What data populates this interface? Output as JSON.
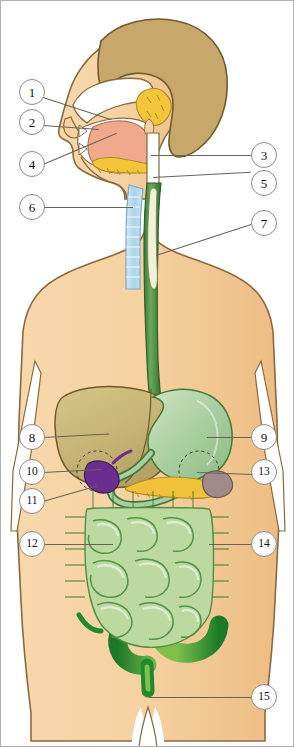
{
  "diagram": {
    "view": "sagittal head and anterior torso",
    "background_color": "#ffffff",
    "border_color": "#b0b0b0",
    "palette": {
      "skin": "#f5cf9d",
      "skin_shadow": "#eabf86",
      "skin_outline": "#8a6a3c",
      "hair": "#c8a76a",
      "hair_outline": "#6e5a33",
      "tongue": "#f0a98b",
      "salivary_gland": "#f2c githubusercontent",
      "salivary": "#f3c53a",
      "trachea": "#b8dced",
      "esophagus": "#4e8f43",
      "esophagus_lumen": "#f2f0d8",
      "liver": "#c9b877",
      "liver_outline": "#6b5a2a",
      "stomach": "#a9cfa0",
      "stomach_outline": "#3f7a3a",
      "gallbladder": "#6b2e8f",
      "pancreas": "#f0c23a",
      "spleen": "#a08a8a",
      "large_intestine": "#1f8a2e",
      "small_intestine": "#bcd9a0",
      "small_intestine_outline": "#4e8f43",
      "leader_line": "#6b6257",
      "callout_ring": "#8a8a8a"
    },
    "callouts": [
      {
        "n": "1",
        "label": "1",
        "side": "left",
        "x": 18,
        "y": 78,
        "target_x": 108,
        "target_y": 120,
        "organ": "nasal-cavity"
      },
      {
        "n": "2",
        "label": "2",
        "side": "left",
        "x": 18,
        "y": 108,
        "target_x": 96,
        "target_y": 128,
        "organ": "oral-cavity"
      },
      {
        "n": "3",
        "label": "3",
        "side": "right",
        "x": 250,
        "y": 141,
        "target_x": 148,
        "target_y": 148,
        "organ": "pharynx"
      },
      {
        "n": "4",
        "label": "4",
        "side": "left",
        "x": 18,
        "y": 150,
        "target_x": 118,
        "target_y": 120,
        "organ": "tongue"
      },
      {
        "n": "5",
        "label": "5",
        "side": "right",
        "x": 250,
        "y": 169,
        "target_x": 150,
        "target_y": 168,
        "organ": "salivary-glands"
      },
      {
        "n": "6",
        "label": "6",
        "side": "left",
        "x": 18,
        "y": 193,
        "target_x": 131,
        "target_y": 200,
        "organ": "trachea"
      },
      {
        "n": "7",
        "label": "7",
        "side": "right",
        "x": 250,
        "y": 209,
        "target_x": 152,
        "target_y": 252,
        "organ": "esophagus"
      },
      {
        "n": "8",
        "label": "8",
        "side": "left",
        "x": 18,
        "y": 423,
        "target_x": 104,
        "target_y": 430,
        "organ": "liver"
      },
      {
        "n": "9",
        "label": "9",
        "side": "right",
        "x": 250,
        "y": 423,
        "target_x": 206,
        "target_y": 430,
        "organ": "stomach"
      },
      {
        "n": "10",
        "label": "10",
        "side": "left",
        "x": 18,
        "y": 458,
        "target_x": 96,
        "target_y": 470,
        "organ": "gallbladder"
      },
      {
        "n": "11",
        "label": "11",
        "side": "left",
        "x": 18,
        "y": 487,
        "target_x": 96,
        "target_y": 478,
        "organ": "duodenum"
      },
      {
        "n": "12",
        "label": "12",
        "side": "left",
        "x": 18,
        "y": 530,
        "target_x": 110,
        "target_y": 542,
        "organ": "small-intestine"
      },
      {
        "n": "13",
        "label": "13",
        "side": "right",
        "x": 250,
        "y": 458,
        "target_x": 196,
        "target_y": 470,
        "organ": "pancreas"
      },
      {
        "n": "14",
        "label": "14",
        "side": "right",
        "x": 250,
        "y": 530,
        "target_x": 208,
        "target_y": 542,
        "organ": "large-intestine"
      },
      {
        "n": "15",
        "label": "15",
        "side": "right",
        "x": 250,
        "y": 683,
        "target_x": 148,
        "target_y": 690,
        "organ": "rectum-anus"
      }
    ]
  }
}
